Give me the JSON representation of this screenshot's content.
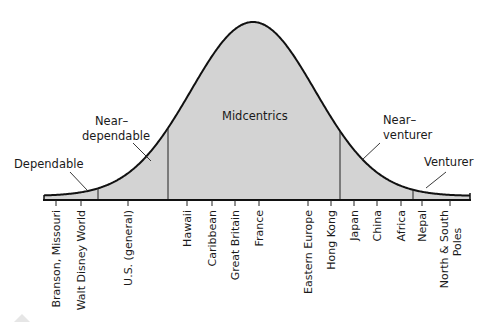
{
  "diagram": {
    "type": "bell-curve",
    "title": "",
    "colors": {
      "fill": "#d3d3d3",
      "stroke": "#111111",
      "text": "#1a1a1a"
    },
    "segments": [
      {
        "label": "Dependable",
        "lines": [
          "Dependable"
        ]
      },
      {
        "label": "Near-dependable",
        "lines": [
          "Near–",
          "dependable"
        ]
      },
      {
        "label": "Midcentrics",
        "lines": [
          "Midcentrics"
        ]
      },
      {
        "label": "Near-venturer",
        "lines": [
          "Near–",
          "venturer"
        ]
      },
      {
        "label": "Venturer",
        "lines": [
          "Venturer"
        ]
      }
    ],
    "destinations": [
      {
        "lines": [
          "Branson, Missouri"
        ]
      },
      {
        "lines": [
          "Walt Disney World"
        ]
      },
      {
        "lines": [
          "U.S. (general)"
        ]
      },
      {
        "lines": [
          "Hawaii"
        ]
      },
      {
        "lines": [
          "Caribbean"
        ]
      },
      {
        "lines": [
          "Great Britain"
        ]
      },
      {
        "lines": [
          "France"
        ]
      },
      {
        "lines": [
          "Eastern Europe"
        ]
      },
      {
        "lines": [
          "Hong Kong"
        ]
      },
      {
        "lines": [
          "Japan"
        ]
      },
      {
        "lines": [
          "China"
        ]
      },
      {
        "lines": [
          "Africa"
        ]
      },
      {
        "lines": [
          "Nepal"
        ]
      },
      {
        "lines": [
          "North & South",
          "Poles"
        ]
      }
    ]
  }
}
